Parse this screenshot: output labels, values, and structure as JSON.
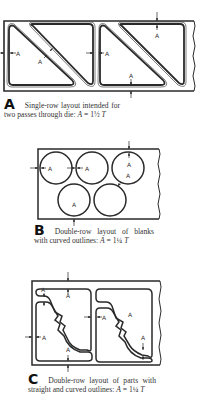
{
  "figures": [
    {
      "id": "A",
      "letter": "A",
      "caption_text": "Single-row layout intended for two passes through die:",
      "formula_var": "A",
      "formula_eq": " =  1½ ",
      "formula_unit": "T",
      "dimension_label": "A"
    },
    {
      "id": "B",
      "letter": "B",
      "caption_text": "Double-row layout of blanks with curved outlines:",
      "formula_var": "A",
      "formula_eq": " = 1¼ ",
      "formula_unit": "T",
      "dimension_label": "A"
    },
    {
      "id": "C",
      "letter": "C",
      "caption_text": "Double-row layout of parts with straight and curved outlines:",
      "formula_var": "A",
      "formula_eq": " = 1¼ ",
      "formula_unit": "T",
      "dimension_label": "A"
    }
  ],
  "colors": {
    "line": "#2a2a2a",
    "background": "#ffffff"
  }
}
